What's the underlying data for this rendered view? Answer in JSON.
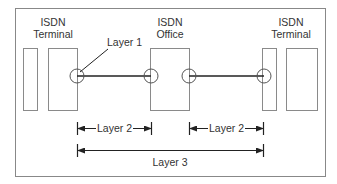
{
  "diagram": {
    "nodes": [
      {
        "id": "left-terminal",
        "label_line1": "ISDN",
        "label_line2": "Terminal"
      },
      {
        "id": "office",
        "label_line1": "ISDN",
        "label_line2": "Office"
      },
      {
        "id": "right-terminal",
        "label_line1": "ISDN",
        "label_line2": "Terminal"
      }
    ],
    "annotations": {
      "layer1": "Layer 1",
      "layer2_left": "Layer 2",
      "layer2_right": "Layer 2",
      "layer3": "Layer 3"
    },
    "colors": {
      "frame": "#888888",
      "box": "#8a8a8a",
      "line": "#222222",
      "text": "#333333"
    }
  }
}
